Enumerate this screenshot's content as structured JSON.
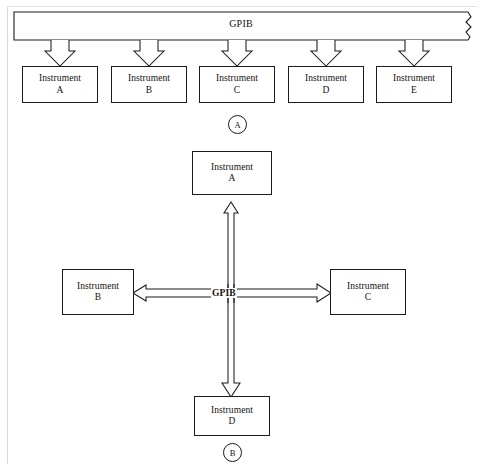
{
  "figure": {
    "bus_name": "GPIB"
  },
  "panel_a": {
    "tag": "A",
    "bus_label": "GPIB",
    "topology": "linear-star",
    "instruments": [
      {
        "line1": "Instrument",
        "line2": "A"
      },
      {
        "line1": "Instrument",
        "line2": "B"
      },
      {
        "line1": "Instrument",
        "line2": "C"
      },
      {
        "line1": "Instrument",
        "line2": "D"
      },
      {
        "line1": "Instrument",
        "line2": "E"
      }
    ]
  },
  "panel_b": {
    "tag": "B",
    "bus_label": "GPIB",
    "topology": "star",
    "instruments": {
      "top": {
        "line1": "Instrument",
        "line2": "A"
      },
      "left": {
        "line1": "Instrument",
        "line2": "B"
      },
      "right": {
        "line1": "Instrument",
        "line2": "C"
      },
      "bottom": {
        "line1": "Instrument",
        "line2": "D"
      }
    }
  },
  "colors": {
    "stroke": "#1b1b1b",
    "fill": "#ffffff",
    "page_edge": "#d8d8d8"
  }
}
